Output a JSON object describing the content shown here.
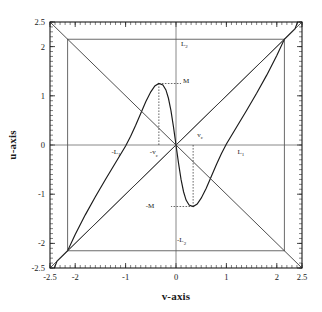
{
  "chart_data": {
    "type": "line",
    "title": "",
    "xlabel": "v-axis",
    "ylabel": "u-axis",
    "xlim": [
      -2.5,
      2.5
    ],
    "ylim": [
      -2.5,
      2.5
    ],
    "grid": false,
    "legend": "none",
    "xticks": [
      -2.5,
      -2,
      -1,
      0,
      1,
      2,
      2.5
    ],
    "xticklabels": [
      "-2.5",
      "-2",
      "-1",
      "0",
      "1",
      "2",
      "2.5"
    ],
    "yticks": [
      2.5,
      2,
      1,
      0,
      -1,
      -2,
      -2.5
    ],
    "yticklabels": [
      "2.5",
      "2",
      "1",
      "0",
      "-1",
      "-2",
      "-2.5"
    ],
    "minor_ticks": true,
    "box_half_width": 2.15,
    "critical_v": 0.34,
    "critical_M": 1.25,
    "series": [
      {
        "name": "cubic-curve",
        "comment": "S-shaped cubic through origin, local max at (-vc, M), local min at (vc, -M), rising to box corners",
        "points": [
          [
            -2.5,
            -2.72
          ],
          [
            -2.36,
            -2.36
          ],
          [
            -2.15,
            -2.15
          ],
          [
            -2.0,
            -1.82
          ],
          [
            -1.8,
            -1.42
          ],
          [
            -1.6,
            -1.05
          ],
          [
            -1.4,
            -0.7
          ],
          [
            -1.2,
            -0.36
          ],
          [
            -1.0,
            -0.02
          ],
          [
            -0.9,
            0.18
          ],
          [
            -0.8,
            0.4
          ],
          [
            -0.7,
            0.64
          ],
          [
            -0.6,
            0.88
          ],
          [
            -0.5,
            1.08
          ],
          [
            -0.42,
            1.2
          ],
          [
            -0.34,
            1.25
          ],
          [
            -0.26,
            1.22
          ],
          [
            -0.2,
            1.12
          ],
          [
            -0.15,
            0.95
          ],
          [
            -0.1,
            0.7
          ],
          [
            -0.05,
            0.37
          ],
          [
            0.0,
            0.0
          ],
          [
            0.05,
            -0.37
          ],
          [
            0.1,
            -0.7
          ],
          [
            0.15,
            -0.95
          ],
          [
            0.2,
            -1.12
          ],
          [
            0.26,
            -1.22
          ],
          [
            0.34,
            -1.25
          ],
          [
            0.42,
            -1.2
          ],
          [
            0.5,
            -1.08
          ],
          [
            0.6,
            -0.88
          ],
          [
            0.7,
            -0.64
          ],
          [
            0.8,
            -0.4
          ],
          [
            0.9,
            -0.18
          ],
          [
            1.0,
            0.02
          ],
          [
            1.2,
            0.36
          ],
          [
            1.4,
            0.7
          ],
          [
            1.6,
            1.05
          ],
          [
            1.8,
            1.42
          ],
          [
            2.0,
            1.82
          ],
          [
            2.15,
            2.15
          ],
          [
            2.36,
            2.36
          ],
          [
            2.5,
            2.72
          ]
        ]
      },
      {
        "name": "diagonal-rising",
        "comment": "line u = v, from bottom-left to top-right",
        "points": [
          [
            -2.5,
            -2.5
          ],
          [
            2.5,
            2.5
          ]
        ]
      },
      {
        "name": "diagonal-falling",
        "comment": "line u = -v, from top-left to bottom-right",
        "points": [
          [
            -2.5,
            2.5
          ],
          [
            2.5,
            -2.5
          ]
        ]
      },
      {
        "name": "chord-left-to-corner",
        "comment": "line from bottom-left box corner up to top-right box corner region",
        "points": [
          [
            -2.15,
            -2.15
          ],
          [
            2.15,
            2.15
          ]
        ]
      }
    ],
    "annotations": [
      {
        "name": "L2",
        "text": "L",
        "sub": "2",
        "prefix": "",
        "v": 0.1,
        "u": 2.02
      },
      {
        "name": "minus-L2",
        "text": "L",
        "sub": "2",
        "prefix": "-",
        "v": 0.02,
        "u": -1.98
      },
      {
        "name": "minus-L1",
        "text": "L",
        "sub": "1",
        "prefix": "-",
        "v": -1.28,
        "u": -0.18
      },
      {
        "name": "L1",
        "text": "L",
        "sub": "1",
        "prefix": "",
        "v": 1.22,
        "u": -0.18
      },
      {
        "name": "M",
        "text": "M",
        "sub": "",
        "prefix": "",
        "v": 0.14,
        "u": 1.27
      },
      {
        "name": "minus-M",
        "text": "M",
        "sub": "",
        "prefix": "-",
        "v": -0.6,
        "u": -1.28
      },
      {
        "name": "minus-vc",
        "text": "v",
        "sub": "c",
        "prefix": "-",
        "v": -0.52,
        "u": -0.19
      },
      {
        "name": "vc",
        "text": "v",
        "sub": "c",
        "prefix": "",
        "v": 0.42,
        "u": 0.17
      }
    ],
    "guides": [
      {
        "name": "guide-max-vertical",
        "from": [
          -0.34,
          0.0
        ],
        "to": [
          -0.34,
          1.25
        ]
      },
      {
        "name": "guide-max-horizontal",
        "from": [
          -0.34,
          1.25
        ],
        "to": [
          0.1,
          1.25
        ]
      },
      {
        "name": "guide-min-vertical",
        "from": [
          0.34,
          0.0
        ],
        "to": [
          0.34,
          -1.25
        ]
      },
      {
        "name": "guide-min-horizontal",
        "from": [
          0.34,
          -1.25
        ],
        "to": [
          -0.1,
          -1.25
        ]
      }
    ]
  }
}
